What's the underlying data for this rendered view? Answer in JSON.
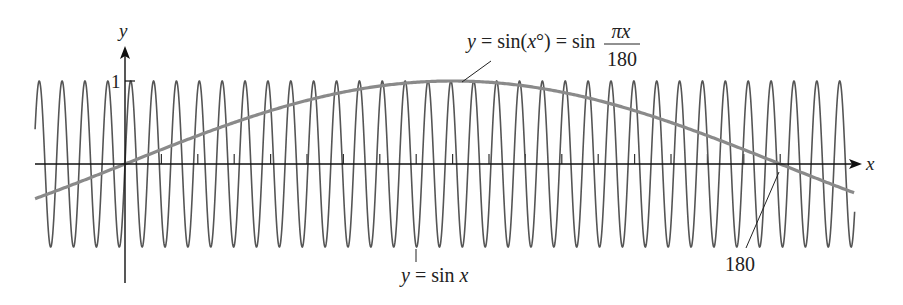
{
  "chart_data": {
    "type": "line",
    "title": "",
    "xlabel": "x",
    "ylabel": "y",
    "xlim": [
      -24.7,
      200.5
    ],
    "ylim": [
      -1,
      1
    ],
    "x_ticks_every": 10,
    "y_tick_labels": [
      "1"
    ],
    "x_tick_label_annotated": "180",
    "series": [
      {
        "name": "y = sin x",
        "function": "sin(x)",
        "color": "#555555",
        "x_range": [
          -24.7,
          200.5
        ]
      },
      {
        "name": "y = sin(x°) = sin(πx/180)",
        "function": "sin(pi*x/180)",
        "color": "#888888",
        "x_range": [
          -24.7,
          200.5
        ]
      }
    ],
    "annotations": [
      {
        "text_parts": [
          "y",
          " = sin(",
          "x",
          "°) = sin "
        ],
        "fraction": {
          "num": "πx",
          "den": "180"
        },
        "points_to": "peak of sin(x°) near x=90"
      },
      {
        "text_parts": [
          "y",
          " = sin ",
          "x"
        ],
        "points_to": "sin x curve"
      },
      {
        "text": "180",
        "points_to": "x-axis at x=180"
      }
    ],
    "grid": false,
    "legend": "none"
  }
}
